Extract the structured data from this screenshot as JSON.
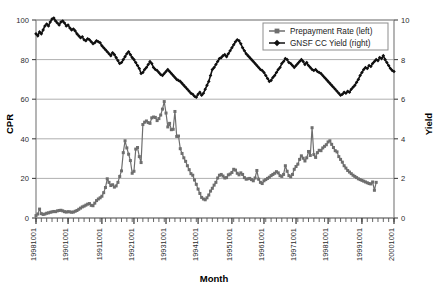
{
  "chart_data": {
    "type": "line",
    "title": "",
    "xlabel": "Month",
    "ylabel": "CPR",
    "y2label": "Yield",
    "ylim": [
      0,
      100
    ],
    "y2lim": [
      0,
      10
    ],
    "grid": true,
    "legend_position": "top-right",
    "yticks": [
      "0",
      "20",
      "40",
      "60",
      "80",
      "100"
    ],
    "y2ticks": [
      "0",
      "2",
      "4",
      "6",
      "8",
      "10"
    ],
    "xtick_labels": [
      "19981001",
      "19901001",
      "19911001",
      "19921001",
      "19931001",
      "19941001",
      "19951001",
      "19961001",
      "19971001",
      "19981001",
      "19991001",
      "20001001"
    ],
    "xtick_positions_months": [
      0,
      12,
      24,
      36,
      48,
      60,
      72,
      84,
      96,
      108,
      120,
      132
    ],
    "x_start_label": "19981001",
    "x_end_label": "20001001",
    "series": [
      {
        "name": "Prepayment Rate (left)",
        "axis": "left",
        "color": "#6e6e6e",
        "marker": "square",
        "values": [
          1.2,
          2.0,
          4.5,
          2.2,
          1.8,
          2.0,
          2.4,
          2.6,
          2.9,
          3.1,
          3.3,
          3.2,
          3.6,
          3.8,
          3.9,
          3.6,
          3.2,
          3.0,
          3.2,
          3.1,
          2.9,
          3.0,
          3.4,
          3.8,
          4.4,
          5.0,
          5.6,
          6.0,
          6.5,
          7.0,
          7.3,
          6.4,
          6.2,
          7.5,
          8.8,
          9.6,
          10.2,
          11.0,
          12.8,
          15.4,
          19.8,
          18.0,
          16.4,
          16.8,
          15.6,
          16.2,
          18.0,
          21.0,
          23.8,
          33.0,
          39.0,
          35.4,
          32.2,
          29.0,
          22.6,
          23.6,
          34.8,
          35.6,
          31.0,
          28.0,
          47.2,
          48.4,
          49.0,
          48.2,
          47.8,
          50.6,
          51.0,
          50.8,
          49.2,
          50.2,
          52.0,
          55.0,
          58.8,
          53.0,
          46.0,
          47.8,
          44.6,
          44.8,
          53.8,
          41.2,
          41.4,
          35.0,
          32.6,
          30.4,
          28.6,
          26.4,
          24.4,
          22.4,
          21.6,
          19.2,
          17.0,
          14.6,
          12.4,
          10.4,
          9.6,
          9.2,
          10.2,
          11.6,
          13.6,
          15.0,
          16.6,
          18.0,
          20.2,
          21.6,
          22.0,
          21.2,
          20.2,
          20.4,
          21.8,
          22.2,
          23.0,
          24.6,
          24.2,
          22.6,
          21.8,
          22.8,
          22.0,
          20.4,
          19.6,
          19.8,
          20.0,
          19.4,
          18.8,
          20.2,
          24.0,
          19.6,
          18.0,
          17.4,
          18.8,
          19.4,
          20.0,
          20.6,
          21.4,
          22.0,
          22.6,
          23.4,
          22.8,
          21.4,
          21.0,
          22.0,
          26.4,
          23.6,
          21.4,
          20.8,
          22.0,
          24.6,
          26.0,
          27.2,
          29.6,
          31.4,
          30.2,
          28.8,
          30.4,
          33.6,
          31.6,
          45.6,
          32.0,
          30.6,
          33.0,
          34.2,
          34.0,
          35.4,
          36.2,
          37.0,
          38.4,
          39.0,
          37.2,
          35.6,
          34.0,
          33.4,
          31.0,
          29.6,
          28.2,
          26.4,
          25.2,
          24.0,
          23.2,
          22.4,
          21.6,
          21.0,
          20.4,
          19.8,
          19.4,
          19.0,
          18.6,
          18.2,
          17.8,
          17.4,
          17.2,
          18.2,
          14.0,
          18.0
        ]
      },
      {
        "name": "GNSF CC Yield (right)",
        "axis": "right",
        "color": "#111111",
        "marker": "diamond",
        "values": [
          9.3,
          9.2,
          9.4,
          9.3,
          9.5,
          9.7,
          9.8,
          9.7,
          9.9,
          10.05,
          10.1,
          9.95,
          9.85,
          9.75,
          9.9,
          9.95,
          9.85,
          9.7,
          9.75,
          9.6,
          9.5,
          9.55,
          9.45,
          9.3,
          9.2,
          9.1,
          9.15,
          9.0,
          8.95,
          9.05,
          9.0,
          8.9,
          8.8,
          8.85,
          8.95,
          8.9,
          8.85,
          8.7,
          8.6,
          8.5,
          8.4,
          8.3,
          8.2,
          8.35,
          8.25,
          8.1,
          7.95,
          7.8,
          7.85,
          8.0,
          8.15,
          8.3,
          8.4,
          8.25,
          8.1,
          8.0,
          7.85,
          7.7,
          7.55,
          7.3,
          7.35,
          7.5,
          7.6,
          7.75,
          7.9,
          7.8,
          7.6,
          7.5,
          7.45,
          7.35,
          7.25,
          7.2,
          7.3,
          7.4,
          7.5,
          7.4,
          7.3,
          7.2,
          7.1,
          7.0,
          6.95,
          6.9,
          6.8,
          6.7,
          6.6,
          6.5,
          6.4,
          6.3,
          6.25,
          6.15,
          6.1,
          6.25,
          6.35,
          6.2,
          6.3,
          6.5,
          6.7,
          6.9,
          7.2,
          7.5,
          7.6,
          7.75,
          7.9,
          8.05,
          8.1,
          8.2,
          8.25,
          8.15,
          8.3,
          8.45,
          8.6,
          8.75,
          8.9,
          9.0,
          8.95,
          8.8,
          8.6,
          8.45,
          8.3,
          8.2,
          8.1,
          8.0,
          7.9,
          7.8,
          7.7,
          7.6,
          7.5,
          7.45,
          7.35,
          7.2,
          7.05,
          6.9,
          6.95,
          7.1,
          7.2,
          7.35,
          7.5,
          7.6,
          7.8,
          7.9,
          8.05,
          8.0,
          7.85,
          7.8,
          7.7,
          7.6,
          7.7,
          7.8,
          7.9,
          8.0,
          7.9,
          7.75,
          7.85,
          7.7,
          7.6,
          7.5,
          7.45,
          7.5,
          7.4,
          7.35,
          7.3,
          7.2,
          7.1,
          7.0,
          6.9,
          6.8,
          6.7,
          6.6,
          6.5,
          6.4,
          6.3,
          6.2,
          6.25,
          6.35,
          6.3,
          6.4,
          6.35,
          6.5,
          6.6,
          6.7,
          6.85,
          7.0,
          7.2,
          7.35,
          7.5,
          7.6,
          7.55,
          7.7,
          7.65,
          7.8,
          7.9,
          8.0,
          7.95,
          8.1,
          8.05,
          8.2,
          8.0,
          7.85,
          7.7,
          7.55,
          7.45,
          7.4
        ]
      }
    ]
  },
  "legend": {
    "items": [
      {
        "label": "Prepayment Rate (left)",
        "marker": "square",
        "color": "#6e6e6e"
      },
      {
        "label": "GNSF CC Yield (right)",
        "marker": "diamond",
        "color": "#111111"
      }
    ]
  },
  "axes": {
    "left_title": "CPR",
    "right_title": "Yield",
    "bottom_title": "Month"
  },
  "colors": {
    "prepayment": "#6e6e6e",
    "yield": "#111111",
    "grid": "#9a9a9a",
    "frame": "#8d8d8d",
    "background": "#ffffff"
  }
}
